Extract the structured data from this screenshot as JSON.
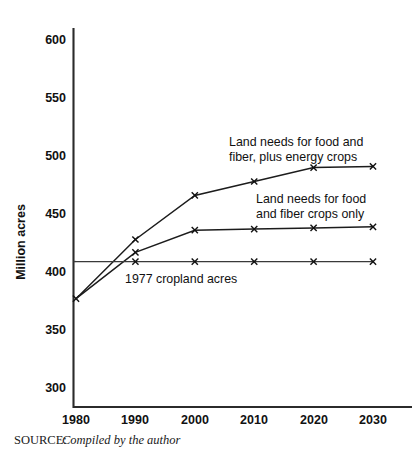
{
  "figure": {
    "source_prefix": "SOURCE:",
    "source_text": "Compiled by the author"
  },
  "chart_data": {
    "type": "line",
    "title": "",
    "xlabel": "",
    "ylabel": "Million acres",
    "x": [
      1980,
      1990,
      2000,
      2010,
      2020,
      2030
    ],
    "xtick_labels": [
      "1980",
      "1990",
      "2000",
      "2010",
      "2020",
      "2030"
    ],
    "ytick_labels": [
      "300",
      "350",
      "400",
      "450",
      "500",
      "550",
      "600"
    ],
    "yticks": [
      300,
      350,
      400,
      450,
      500,
      550,
      600
    ],
    "ylim": [
      280,
      615
    ],
    "xlim": [
      1977,
      2034
    ],
    "grid": false,
    "legend_position": "inline-annotations",
    "marker": "x",
    "series": [
      {
        "name": "Land needs for food and fiber, plus energy crops",
        "values": [
          377,
          428,
          466,
          478,
          490,
          491
        ],
        "annotation": "Land needs for food and\nfiber, plus energy crops",
        "annotation_line1": "Land needs for food and",
        "annotation_line2": "fiber, plus energy crops"
      },
      {
        "name": "Land needs for food and fiber crops only",
        "values": [
          377,
          417,
          436,
          437,
          438,
          439
        ],
        "annotation": "Land needs for food\nand fiber crops only",
        "annotation_line1": "Land needs for food",
        "annotation_line2": "and fiber crops only"
      },
      {
        "name": "1977 cropland acres",
        "values": [
          409,
          409,
          409,
          409,
          409,
          409
        ],
        "annotation": "1977 cropland acres",
        "annotation_line1": "1977 cropland acres",
        "annotation_line2": ""
      }
    ]
  },
  "colors": {
    "ink": "#111111",
    "axis": "#2b2b2b",
    "paper": "#ffffff"
  }
}
